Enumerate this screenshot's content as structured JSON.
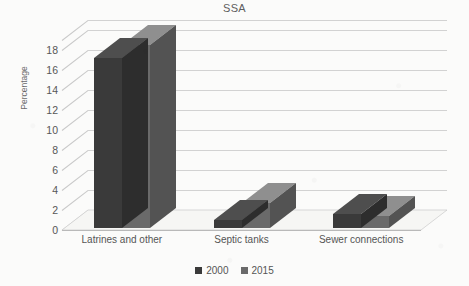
{
  "chart_data": {
    "type": "bar",
    "title": "SSA",
    "subtitle": "",
    "xlabel": "",
    "ylabel": "Percentage",
    "ylim": [
      0,
      19
    ],
    "yticks": [
      0,
      2,
      4,
      6,
      8,
      10,
      12,
      14,
      16,
      18
    ],
    "grid": true,
    "legend_position": "bottom",
    "style": "3d-clustered-column",
    "categories": [
      "Latrines and other",
      "Septic tanks",
      "Sewer connections"
    ],
    "series": [
      {
        "name": "2000",
        "color": "#3a3a3a",
        "values": [
          17.0,
          0.8,
          1.4
        ]
      },
      {
        "name": "2015",
        "color": "#6a6a6a",
        "values": [
          18.3,
          2.5,
          1.2
        ]
      }
    ]
  },
  "axis": {
    "y_label": "Percentage",
    "y_ticks": [
      "18",
      "16",
      "14",
      "12",
      "10",
      "8",
      "6",
      "4",
      "2",
      "0"
    ]
  },
  "legend": {
    "items": [
      {
        "label": "2000",
        "color": "#3a3a3a"
      },
      {
        "label": "2015",
        "color": "#6a6a6a"
      }
    ]
  },
  "colors": {
    "series_2000": "#3a3a3a",
    "series_2015": "#6a6a6a",
    "background": "#fbfbfa",
    "gridline": "#c9c9c9",
    "text": "#555555"
  }
}
